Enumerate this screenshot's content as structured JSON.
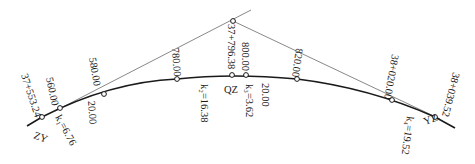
{
  "diagram": {
    "type": "circular-curve-stakeout",
    "intersection_point": {
      "label": "",
      "x": 233,
      "y": 21
    },
    "main_points": [
      {
        "name": "ZY",
        "station": "37+553.24",
        "x": 42,
        "y": 117
      },
      {
        "name": "QZ",
        "station": "37+796.38",
        "x": 232,
        "y": 75
      },
      {
        "name": "YZ",
        "station": "38+039.52",
        "x": 435,
        "y": 117
      }
    ],
    "stations": [
      {
        "label": "560.00",
        "x": 60,
        "y": 108
      },
      {
        "label": "580.00",
        "x": 104,
        "y": 94
      },
      {
        "label": "780.00",
        "x": 177,
        "y": 79
      },
      {
        "label": "800.00",
        "x": 246,
        "y": 75
      },
      {
        "label": "820.00",
        "x": 297,
        "y": 79
      },
      {
        "label": "38+020.00",
        "x": 392,
        "y": 100
      }
    ],
    "segment_lengths": [
      {
        "label": "k₁=6.76"
      },
      {
        "label": "20.00",
        "position": "left"
      },
      {
        "label": "k₂=16.38"
      },
      {
        "label": "k₃=3.62"
      },
      {
        "label": "20.00",
        "position": "right"
      },
      {
        "label": "k₄=19.52"
      }
    ]
  },
  "labels": {
    "zy_name": "ZY",
    "zy_station": "37+553.24",
    "st_560": "560.00",
    "st_580": "580.00",
    "st_780": "780.00",
    "qz_station": "37+796.38",
    "qz_name": "QZ",
    "st_800": "800.00",
    "st_820": "820.00",
    "st_38020": "38+020.00",
    "yz_station": "38+039.52",
    "yz_name": "YZ",
    "k1": "k₁=6.76",
    "len_left": "20.00",
    "k2": "k₂=16.38",
    "k3": "k₃=3.62",
    "len_right": "20.00",
    "k4": "k₄=19.52"
  }
}
